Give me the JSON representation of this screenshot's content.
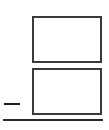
{
  "diagram": {
    "elements": [
      {
        "id": "box-top",
        "type": "rectangle",
        "label": ""
      },
      {
        "id": "box-bottom",
        "type": "rectangle",
        "label": ""
      },
      {
        "id": "dash",
        "type": "line-segment",
        "label": ""
      },
      {
        "id": "baseline",
        "type": "line",
        "label": ""
      }
    ],
    "colors": {
      "background": "#ffffff",
      "stroke": "#3a3a3a",
      "dash": "#1e1e1e",
      "baseline": "#2a2a2a"
    }
  }
}
